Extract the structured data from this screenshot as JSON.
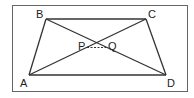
{
  "diagram": {
    "type": "trapezium-with-diagonals",
    "frame": {
      "x": 12,
      "y": 5,
      "w": 176,
      "h": 87
    },
    "vertices": {
      "A": {
        "label": "A",
        "x": 29,
        "y": 75
      },
      "B": {
        "label": "B",
        "x": 46,
        "y": 19
      },
      "C": {
        "label": "C",
        "x": 146,
        "y": 19
      },
      "D": {
        "label": "D",
        "x": 166,
        "y": 75
      }
    },
    "points": {
      "P": {
        "label": "P"
      },
      "Q": {
        "label": "Q"
      }
    },
    "segments": [
      "AB",
      "BC",
      "CD",
      "DA",
      "AC",
      "BD"
    ],
    "dashed_segment": "PQ",
    "colors": {
      "line": "#333333",
      "frame": "#555555"
    }
  }
}
